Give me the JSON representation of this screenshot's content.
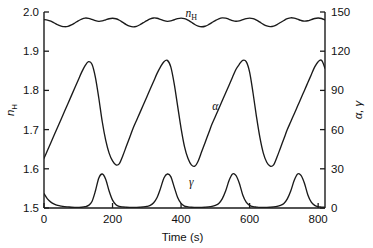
{
  "chart_data": {
    "type": "line",
    "title": "",
    "xlabel": "Time (s)",
    "xlim": [
      0,
      820
    ],
    "xticks": [
      0,
      200,
      400,
      600,
      800
    ],
    "xticklabels": [
      "0",
      "200",
      "400",
      "600",
      "800"
    ],
    "grid": false,
    "legend": "inline-curve-labels",
    "axes": [
      {
        "id": "left",
        "position": "left",
        "label": "nH",
        "label_base": "n",
        "label_sub": "H",
        "ylim": [
          1.5,
          2.0
        ],
        "yticks": [
          1.5,
          1.6,
          1.7,
          1.8,
          1.9,
          2.0
        ],
        "yticklabels": [
          "1.5",
          "1.6",
          "1.7",
          "1.8",
          "1.9",
          "2.0"
        ]
      },
      {
        "id": "right",
        "position": "right",
        "label": "α, γ",
        "ylim": [
          0,
          150
        ],
        "yticks": [
          0,
          30,
          60,
          90,
          120,
          150
        ],
        "yticklabels": [
          "0",
          "30",
          "60",
          "90",
          "120",
          "150"
        ]
      }
    ],
    "series": [
      {
        "name": "nH",
        "label": "nH",
        "label_base": "n",
        "label_sub": "H",
        "axis": "left",
        "units": "",
        "color": "#1a1a1a",
        "annotation_xy": [
          430,
          1.988
        ],
        "description": "Small-amplitude compound oscillation between about 1.955 and 1.995, alternating shallow and deep troughs, four major periods across 800 s",
        "x": [
          0,
          10,
          20,
          30,
          40,
          50,
          60,
          70,
          80,
          90,
          100,
          110,
          120,
          130,
          140,
          150,
          160,
          170,
          180,
          190,
          200,
          210,
          220,
          230,
          240,
          250,
          260,
          270,
          280,
          290,
          300,
          310,
          320,
          330,
          340,
          350,
          360,
          370,
          380,
          390,
          400,
          410,
          420,
          430,
          440,
          450,
          460,
          470,
          480,
          490,
          500,
          510,
          520,
          530,
          540,
          550,
          560,
          570,
          580,
          590,
          600,
          610,
          620,
          630,
          640,
          650,
          660,
          670,
          680,
          690,
          700,
          710,
          720,
          730,
          740,
          750,
          760,
          770,
          780,
          790,
          800,
          810,
          820
        ],
        "y": [
          1.9805,
          1.9795,
          1.9765,
          1.972,
          1.9675,
          1.964,
          1.9625,
          1.9635,
          1.967,
          1.972,
          1.9775,
          1.982,
          1.9845,
          1.9838,
          1.981,
          1.9778,
          1.9762,
          1.9772,
          1.98,
          1.9828,
          1.984,
          1.9828,
          1.979,
          1.9735,
          1.968,
          1.964,
          1.9622,
          1.9635,
          1.9675,
          1.9728,
          1.978,
          1.9824,
          1.9848,
          1.984,
          1.9812,
          1.978,
          1.9762,
          1.9772,
          1.9802,
          1.983,
          1.9843,
          1.983,
          1.9792,
          1.9738,
          1.9682,
          1.9642,
          1.9624,
          1.9636,
          1.9676,
          1.973,
          1.9782,
          1.9826,
          1.985,
          1.9842,
          1.9814,
          1.9782,
          1.9764,
          1.9774,
          1.9804,
          1.9832,
          1.9845,
          1.9832,
          1.9794,
          1.974,
          1.9684,
          1.9644,
          1.9626,
          1.9638,
          1.9678,
          1.9732,
          1.9784,
          1.9828,
          1.9852,
          1.9844,
          1.9816,
          1.9784,
          1.9766,
          1.9776,
          1.9806,
          1.9834,
          1.9846,
          1.9834,
          1.9796
        ]
      },
      {
        "name": "alpha",
        "label": "α",
        "axis": "right",
        "units": "",
        "color": "#1a1a1a",
        "annotation_xy": [
          500,
          75
        ],
        "description": "Relaxation (sawtooth) oscillation: slow rise to about 112 then rapid fall to about 33, period roughly 195 s, four cycles",
        "x": [
          0,
          10,
          20,
          30,
          40,
          50,
          60,
          70,
          80,
          90,
          100,
          110,
          120,
          130,
          140,
          150,
          160,
          170,
          180,
          190,
          200,
          210,
          220,
          230,
          240,
          250,
          260,
          270,
          280,
          290,
          300,
          310,
          320,
          330,
          340,
          350,
          360,
          370,
          380,
          390,
          400,
          410,
          420,
          430,
          440,
          450,
          460,
          470,
          480,
          490,
          500,
          510,
          520,
          530,
          540,
          550,
          560,
          570,
          580,
          590,
          600,
          610,
          620,
          630,
          640,
          650,
          660,
          670,
          680,
          690,
          700,
          710,
          720,
          730,
          740,
          750,
          760,
          770,
          780,
          790,
          800,
          810,
          820
        ],
        "y": [
          38,
          44,
          50,
          56,
          62,
          68,
          74,
          80,
          86,
          92,
          98,
          104,
          109,
          112,
          110,
          100,
          84,
          66,
          52,
          42,
          36,
          33,
          34,
          40,
          47,
          54,
          61,
          67,
          73,
          79,
          85,
          91,
          97,
          103,
          108,
          112,
          113,
          108,
          95,
          78,
          61,
          47,
          38,
          33,
          32,
          36,
          43,
          50,
          57,
          64,
          70,
          76,
          82,
          88,
          94,
          100,
          106,
          110,
          113,
          112,
          104,
          88,
          70,
          54,
          42,
          35,
          32,
          33,
          39,
          46,
          53,
          60,
          66,
          72,
          78,
          84,
          90,
          96,
          102,
          108,
          112,
          113,
          107
        ]
      },
      {
        "name": "gamma",
        "label": "γ",
        "axis": "right",
        "units": "",
        "color": "#1a1a1a",
        "annotation_xy": [
          430,
          17
        ],
        "description": "Sharp narrow spikes near the baseline, peaking about 26 at 165, 360, 545 and 740 s, near zero between spikes",
        "x": [
          0,
          10,
          20,
          30,
          40,
          50,
          60,
          70,
          80,
          90,
          100,
          110,
          120,
          130,
          140,
          150,
          160,
          170,
          180,
          190,
          200,
          210,
          220,
          230,
          240,
          250,
          260,
          270,
          280,
          290,
          300,
          310,
          320,
          330,
          340,
          350,
          360,
          370,
          380,
          390,
          400,
          410,
          420,
          430,
          440,
          450,
          460,
          470,
          480,
          490,
          500,
          510,
          520,
          530,
          540,
          550,
          560,
          570,
          580,
          590,
          600,
          610,
          620,
          630,
          640,
          650,
          660,
          670,
          680,
          690,
          700,
          710,
          720,
          730,
          740,
          750,
          760,
          770,
          780,
          790,
          800,
          810,
          820
        ],
        "y": [
          11,
          7,
          4.5,
          3,
          2,
          1.4,
          1,
          0.8,
          0.6,
          0.5,
          0.5,
          0.6,
          1,
          2,
          5,
          13,
          23,
          26,
          22,
          13,
          6,
          2.5,
          1.2,
          0.8,
          0.6,
          0.5,
          0.5,
          0.5,
          0.6,
          0.8,
          1.2,
          2,
          4,
          8,
          15,
          23,
          26,
          24,
          16,
          8,
          3.5,
          1.5,
          0.9,
          0.6,
          0.5,
          0.5,
          0.5,
          0.6,
          0.8,
          1.2,
          2,
          3.5,
          7,
          13,
          21,
          26,
          25,
          19,
          10,
          4.5,
          2,
          1,
          0.7,
          0.5,
          0.5,
          0.5,
          0.6,
          0.8,
          1.2,
          2,
          3.5,
          7,
          13,
          21,
          26,
          25,
          19,
          10,
          4.5,
          2,
          1,
          0.7,
          0.5
        ]
      }
    ]
  },
  "accent_color": "#1a1a1a",
  "background_color": "#ffffff"
}
